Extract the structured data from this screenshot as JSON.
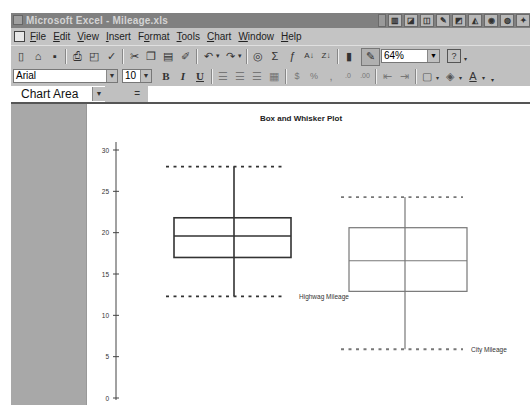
{
  "window": {
    "title": "Microsoft Excel - Mileage.xls",
    "title_buttons": [
      "btn1",
      "btn2",
      "btn3",
      "btn4",
      "btn5",
      "btn6",
      "btn7",
      "btn8",
      "btn9",
      "btn10"
    ]
  },
  "menubar": {
    "items": [
      {
        "label": "File",
        "accel": "F"
      },
      {
        "label": "Edit",
        "accel": "E"
      },
      {
        "label": "View",
        "accel": "V"
      },
      {
        "label": "Insert",
        "accel": "I"
      },
      {
        "label": "Format",
        "accel": "o"
      },
      {
        "label": "Tools",
        "accel": "T"
      },
      {
        "label": "Chart",
        "accel": "C"
      },
      {
        "label": "Window",
        "accel": "W"
      },
      {
        "label": "Help",
        "accel": "H"
      }
    ]
  },
  "toolbar": {
    "zoom_value": "64%",
    "font_name": "Arial",
    "font_size": "10",
    "bold_label": "B",
    "italic_label": "I",
    "underline_label": "U"
  },
  "formula_bar": {
    "name_box": "Chart Area",
    "equals": "=",
    "formula": ""
  },
  "chart_data": {
    "type": "box",
    "title": "Box and Whisker Plot",
    "xlabel": "",
    "ylabel": "",
    "ylim": [
      0,
      30
    ],
    "yticks": [
      0,
      5,
      10,
      15,
      20,
      25,
      30
    ],
    "grid": false,
    "legend": "none (series labels placed beside min whisker)",
    "series": [
      {
        "name": "Highway Mileage",
        "label_text": "Highwag Mileage",
        "min": 12.3,
        "q1": 17.0,
        "median": 19.6,
        "q3": 21.8,
        "max": 28.0,
        "color": "#333333"
      },
      {
        "name": "City Mileage",
        "label_text": "City Mileage",
        "min": 5.9,
        "q1": 12.9,
        "median": 16.6,
        "q3": 20.6,
        "max": 24.3,
        "color": "#777777"
      }
    ]
  }
}
